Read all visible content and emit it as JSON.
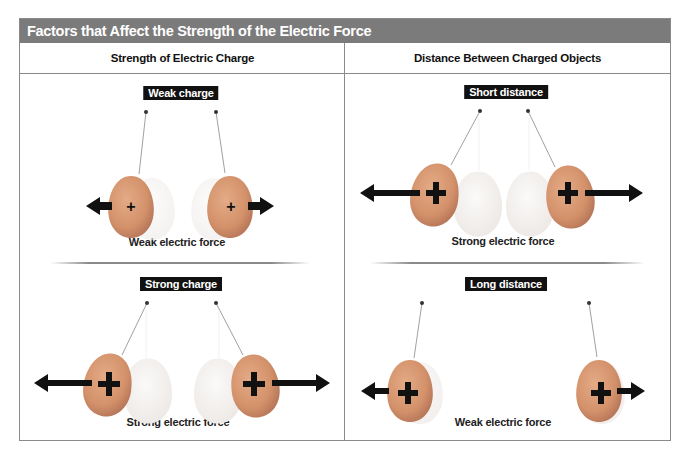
{
  "figure": {
    "title": "Factors that Affect the Strength of the Electric Force",
    "colors": {
      "titlebar": "#7b7b7b",
      "border": "#8a8a8a",
      "balloon": "#d99a72",
      "ghost_balloon": "#f3f0ee",
      "arrow": "#111111"
    },
    "columns": [
      {
        "header": "Strength of Electric Charge",
        "panels": [
          {
            "label": "Weak charge",
            "caption": "Weak electric force",
            "charge_symbol": "+",
            "symbol_size": "small",
            "arrow_length": "short"
          },
          {
            "label": "Strong charge",
            "caption": "Strong electric force",
            "charge_symbol": "+",
            "symbol_size": "large",
            "arrow_length": "long"
          }
        ]
      },
      {
        "header": "Distance Between Charged Objects",
        "panels": [
          {
            "label": "Short distance",
            "caption": "Strong electric force",
            "charge_symbol": "+",
            "symbol_size": "large",
            "arrow_length": "long"
          },
          {
            "label": "Long distance",
            "caption": "Weak electric force",
            "charge_symbol": "+",
            "symbol_size": "large",
            "arrow_length": "short"
          }
        ]
      }
    ]
  }
}
